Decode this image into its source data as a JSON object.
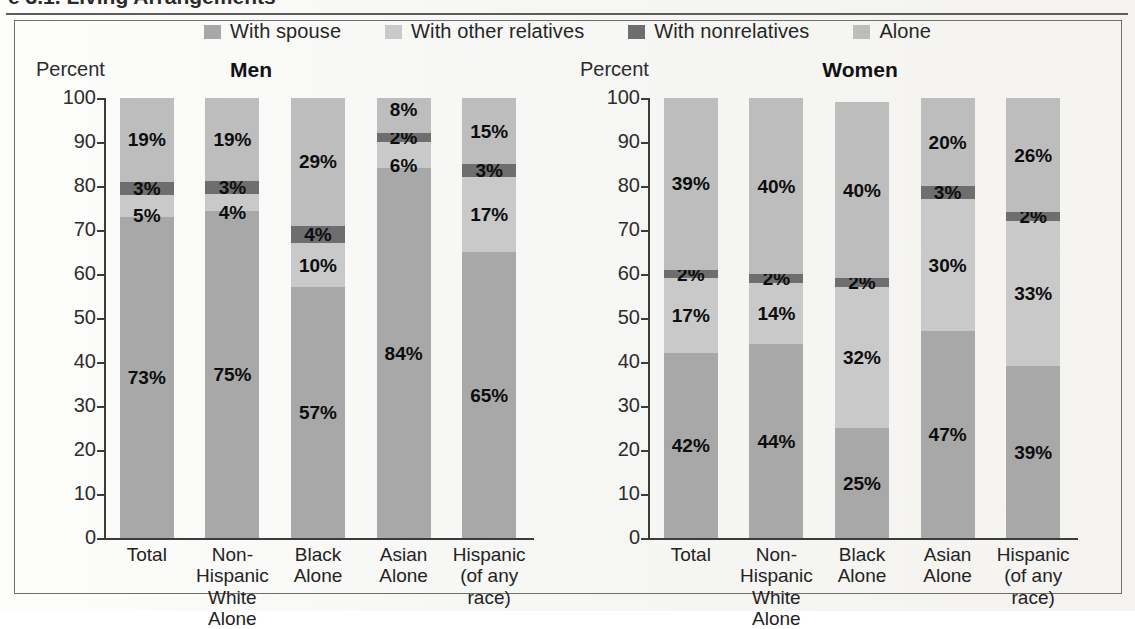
{
  "figure": {
    "cropped_heading": "e 3.1. Living Arrangements",
    "legend": [
      {
        "label": "With spouse",
        "color": "#a8a8a8",
        "key": "spouse"
      },
      {
        "label": "With other relatives",
        "color": "#c9c9c9",
        "key": "other_relatives"
      },
      {
        "label": "With nonrelatives",
        "color": "#6e6e6e",
        "key": "nonrelatives"
      },
      {
        "label": "Alone",
        "color": "#bdbdbd",
        "key": "alone"
      }
    ],
    "axis_title": "Percent",
    "zero_label": "0"
  },
  "chart_data": {
    "type": "bar",
    "stacked": true,
    "title": "",
    "xlabel": "",
    "ylabel": "Percent",
    "ylim": [
      0,
      100
    ],
    "yticks": [
      0,
      10,
      20,
      30,
      40,
      50,
      60,
      70,
      80,
      90,
      100
    ],
    "ytick_labels": [
      "0",
      "10",
      "20",
      "30",
      "40",
      "50",
      "60",
      "70",
      "80",
      "90",
      "100"
    ],
    "grid": false,
    "legend_position": "top-center",
    "categories": [
      {
        "line1": "Total",
        "line2": ""
      },
      {
        "line1": "Non-Hispanic",
        "line2": "White Alone"
      },
      {
        "line1": "Black",
        "line2": "Alone"
      },
      {
        "line1": "Asian",
        "line2": "Alone"
      },
      {
        "line1": "Hispanic",
        "line2": "(of any race)"
      }
    ],
    "series_order": [
      "spouse",
      "other_relatives",
      "nonrelatives",
      "alone"
    ],
    "series_colors": {
      "spouse": "#a8a8a8",
      "other_relatives": "#c9c9c9",
      "nonrelatives": "#6e6e6e",
      "alone": "#bdbdbd"
    },
    "panels": [
      {
        "name": "Men",
        "title": "Men",
        "bars": [
          {
            "category": "Total",
            "segments": [
              {
                "key": "spouse",
                "value": 73,
                "label": "73%"
              },
              {
                "key": "other_relatives",
                "value": 5,
                "label": "5%"
              },
              {
                "key": "nonrelatives",
                "value": 3,
                "label": "3%"
              },
              {
                "key": "alone",
                "value": 19,
                "label": "19%"
              }
            ]
          },
          {
            "category": "Non-Hispanic White Alone",
            "segments": [
              {
                "key": "spouse",
                "value": 75,
                "label": "75%"
              },
              {
                "key": "other_relatives",
                "value": 4,
                "label": "4%"
              },
              {
                "key": "nonrelatives",
                "value": 3,
                "label": "3%"
              },
              {
                "key": "alone",
                "value": 19,
                "label": "19%"
              }
            ]
          },
          {
            "category": "Black Alone",
            "segments": [
              {
                "key": "spouse",
                "value": 57,
                "label": "57%"
              },
              {
                "key": "other_relatives",
                "value": 10,
                "label": "10%"
              },
              {
                "key": "nonrelatives",
                "value": 4,
                "label": "4%"
              },
              {
                "key": "alone",
                "value": 29,
                "label": "29%"
              }
            ]
          },
          {
            "category": "Asian Alone",
            "segments": [
              {
                "key": "spouse",
                "value": 84,
                "label": "84%"
              },
              {
                "key": "other_relatives",
                "value": 6,
                "label": "6%"
              },
              {
                "key": "nonrelatives",
                "value": 2,
                "label": "2%"
              },
              {
                "key": "alone",
                "value": 8,
                "label": "8%"
              }
            ]
          },
          {
            "category": "Hispanic (of any race)",
            "segments": [
              {
                "key": "spouse",
                "value": 65,
                "label": "65%"
              },
              {
                "key": "other_relatives",
                "value": 17,
                "label": "17%"
              },
              {
                "key": "nonrelatives",
                "value": 3,
                "label": "3%"
              },
              {
                "key": "alone",
                "value": 15,
                "label": "15%"
              }
            ]
          }
        ]
      },
      {
        "name": "Women",
        "title": "Women",
        "bars": [
          {
            "category": "Total",
            "segments": [
              {
                "key": "spouse",
                "value": 42,
                "label": "42%"
              },
              {
                "key": "other_relatives",
                "value": 17,
                "label": "17%"
              },
              {
                "key": "nonrelatives",
                "value": 2,
                "label": "2%"
              },
              {
                "key": "alone",
                "value": 39,
                "label": "39%"
              }
            ]
          },
          {
            "category": "Non-Hispanic White Alone",
            "segments": [
              {
                "key": "spouse",
                "value": 44,
                "label": "44%"
              },
              {
                "key": "other_relatives",
                "value": 14,
                "label": "14%"
              },
              {
                "key": "nonrelatives",
                "value": 2,
                "label": "2%"
              },
              {
                "key": "alone",
                "value": 40,
                "label": "40%"
              }
            ]
          },
          {
            "category": "Black Alone",
            "segments": [
              {
                "key": "spouse",
                "value": 25,
                "label": "25%"
              },
              {
                "key": "other_relatives",
                "value": 32,
                "label": "32%"
              },
              {
                "key": "nonrelatives",
                "value": 2,
                "label": "2%"
              },
              {
                "key": "alone",
                "value": 40,
                "label": "40%"
              }
            ]
          },
          {
            "category": "Asian Alone",
            "segments": [
              {
                "key": "spouse",
                "value": 47,
                "label": "47%"
              },
              {
                "key": "other_relatives",
                "value": 30,
                "label": "30%"
              },
              {
                "key": "nonrelatives",
                "value": 3,
                "label": "3%"
              },
              {
                "key": "alone",
                "value": 20,
                "label": "20%"
              }
            ]
          },
          {
            "category": "Hispanic (of any race)",
            "segments": [
              {
                "key": "spouse",
                "value": 39,
                "label": "39%"
              },
              {
                "key": "other_relatives",
                "value": 33,
                "label": "33%"
              },
              {
                "key": "nonrelatives",
                "value": 2,
                "label": "2%"
              },
              {
                "key": "alone",
                "value": 26,
                "label": "26%"
              }
            ]
          }
        ]
      }
    ]
  }
}
